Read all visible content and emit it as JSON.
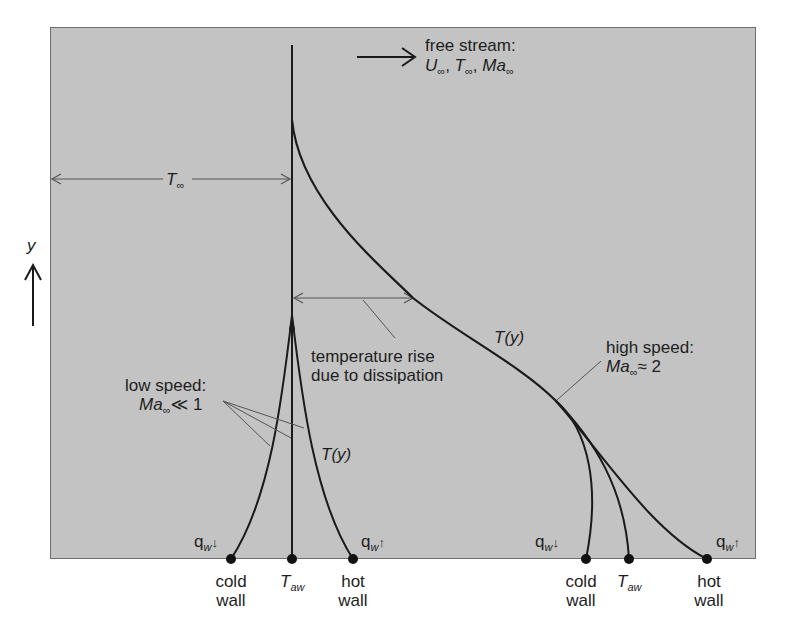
{
  "diagram": {
    "type": "boundary-layer temperature profiles",
    "axis": {
      "label": "y",
      "arrow": "up"
    },
    "free_stream": {
      "line1": "free stream:",
      "U": "U",
      "T": "T",
      "Ma": "Ma",
      "inf": "∞",
      "sep": ", "
    },
    "t_inf_dimension": {
      "T": "T",
      "inf": "∞"
    },
    "dissipation_label": {
      "line1": "temperature rise",
      "line2": "due to dissipation"
    },
    "low_speed": {
      "line1": "low speed:",
      "Ma": "Ma",
      "inf": "∞",
      "relation": "≪ 1",
      "profile_label": "T(y)",
      "points": [
        {
          "q_label": "q",
          "q_sub": "w",
          "q_arrow": "↓",
          "line1": "cold",
          "line2": "wall"
        },
        {
          "T": "T",
          "sub": "aw"
        },
        {
          "q_label": "q",
          "q_sub": "w",
          "q_arrow": "↑",
          "line1": "hot",
          "line2": "wall"
        }
      ]
    },
    "high_speed": {
      "line1": "high speed:",
      "Ma": "Ma",
      "inf": "∞",
      "relation": "≈ 2",
      "profile_label": "T(y)",
      "points": [
        {
          "q_label": "q",
          "q_sub": "w",
          "q_arrow": "↓",
          "line1": "cold",
          "line2": "wall"
        },
        {
          "T": "T",
          "sub": "aw"
        },
        {
          "q_label": "q",
          "q_sub": "w",
          "q_arrow": "↑",
          "line1": "hot",
          "line2": "wall"
        }
      ]
    },
    "colors": {
      "panel": "#c3c3c3",
      "ink": "#1a1a1a",
      "leader": "#555555"
    }
  }
}
